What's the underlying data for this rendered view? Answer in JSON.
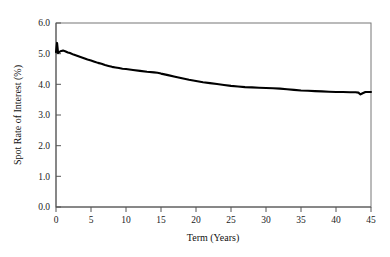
{
  "chart_data": {
    "type": "line",
    "title": "",
    "subtitle": "",
    "xlabel": "Term (Years)",
    "ylabel": "Spot Rate of Interest (%)",
    "xlim": [
      0,
      45
    ],
    "ylim": [
      0.0,
      6.0
    ],
    "xticks": [
      0,
      5,
      10,
      15,
      20,
      25,
      30,
      35,
      40,
      45
    ],
    "xtick_labels": [
      "0",
      "5",
      "10",
      "15",
      "20",
      "25",
      "30",
      "35",
      "40",
      "45"
    ],
    "yticks": [
      0.0,
      1.0,
      2.0,
      3.0,
      4.0,
      5.0,
      6.0
    ],
    "ytick_labels": [
      "0.0",
      "1.0",
      "2.0",
      "3.0",
      "4.0",
      "5.0",
      "6.0"
    ],
    "grid": false,
    "legend": false,
    "legend_position": "none",
    "frame": "box",
    "line_color": "#000000",
    "background_color": "#ffffff",
    "series": [
      {
        "name": "Spot rate curve",
        "x": [
          0.0,
          0.15,
          0.3,
          0.5,
          0.75,
          1.0,
          1.3,
          1.7,
          2.0,
          2.5,
          3.0,
          3.5,
          4.0,
          4.5,
          5.0,
          5.5,
          6.0,
          6.5,
          7.0,
          7.5,
          8.0,
          8.5,
          9.0,
          9.5,
          10.0,
          11.0,
          12.0,
          13.0,
          14.0,
          14.5,
          15.0,
          16.0,
          17.0,
          18.0,
          19.0,
          20.0,
          21.0,
          22.0,
          23.0,
          24.0,
          25.0,
          26.0,
          27.0,
          28.0,
          29.0,
          30.0,
          31.0,
          32.0,
          33.0,
          34.0,
          35.0,
          36.0,
          37.0,
          38.0,
          39.0,
          40.0,
          41.0,
          42.0,
          42.8,
          43.2,
          43.5,
          43.8,
          44.2,
          44.6,
          45.0
        ],
        "y": [
          5.05,
          5.35,
          5.02,
          5.06,
          5.09,
          5.1,
          5.08,
          5.04,
          5.02,
          4.97,
          4.93,
          4.89,
          4.85,
          4.81,
          4.78,
          4.74,
          4.7,
          4.67,
          4.63,
          4.6,
          4.57,
          4.55,
          4.53,
          4.51,
          4.5,
          4.47,
          4.44,
          4.41,
          4.39,
          4.38,
          4.35,
          4.3,
          4.25,
          4.2,
          4.15,
          4.11,
          4.07,
          4.04,
          4.01,
          3.98,
          3.95,
          3.93,
          3.91,
          3.9,
          3.89,
          3.88,
          3.87,
          3.86,
          3.84,
          3.82,
          3.8,
          3.79,
          3.78,
          3.77,
          3.76,
          3.75,
          3.75,
          3.74,
          3.74,
          3.73,
          3.67,
          3.71,
          3.75,
          3.75,
          3.75
        ]
      }
    ]
  },
  "axis": {
    "y_title": "Spot Rate of Interest (%)",
    "x_title": "Term (Years)"
  }
}
